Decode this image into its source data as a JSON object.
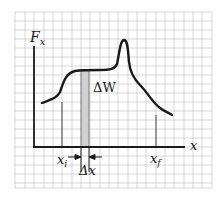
{
  "diagram": {
    "y_axis_label": "F",
    "y_axis_sub": "x",
    "x_axis_label": "x",
    "xi_label": "x",
    "xi_sub": "i",
    "xf_label": "x",
    "xf_sub": "f",
    "delta_x_label": "Δx",
    "delta_w_label": "ΔW",
    "colors": {
      "grid": "#b8b8b8",
      "ink": "#1a1a1a",
      "strip": "#d0d0d0"
    }
  }
}
